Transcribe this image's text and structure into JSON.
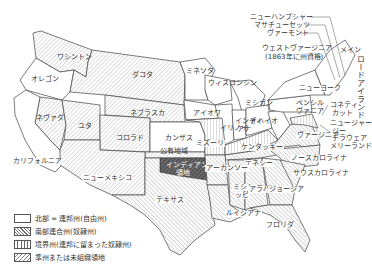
{
  "map": {
    "states": {
      "oregon": "オレゴン",
      "washington": "ワシントン",
      "dakota": "ダコタ",
      "nevada": "ネヴァダ",
      "utah": "ユタ",
      "nebraska": "ネブラスカ",
      "california": "カリフォルニア",
      "colorado": "コロラド",
      "kansas": "カンザス",
      "public_land": "公有地域",
      "new_mexico": "ニューメキシコ",
      "indian_territory_1": "インディアン",
      "indian_territory_2": "領地",
      "texas": "テキサス",
      "minnesota": "ミネソタ",
      "wisconsin": "ウィスコンシン",
      "iowa": "アイオワ",
      "michigan": "ミシガン",
      "illinois": "イリノイ",
      "indiana_1": "インディ",
      "indiana_2": "アナ",
      "ohio": "オハイオ",
      "missouri": "ミズーリ",
      "kentucky": "ケンタッキー",
      "west_virginia_1": "ウェストヴァージニア",
      "west_virginia_2": "(1863年に州資格)",
      "virginia": "ヴァージニア",
      "pennsylvania_1": "ペンシル",
      "pennsylvania_2": "ヴァニア",
      "new_york": "ニューヨーク",
      "new_hampshire": "ニューハンプシャー",
      "massachusetts": "マサチューセッツ",
      "vermont": "ヴァーモント",
      "maine": "メイン",
      "rhode_island": "ロードアイランド",
      "connecticut_1": "コネティ",
      "connecticut_2": "カット",
      "new_jersey_1": "ニュージャー",
      "new_jersey_2": "ジー",
      "delaware": "デラウェア",
      "maryland": "メリーランド",
      "tennessee": "テネシー",
      "arkansas": "アーカンソー",
      "north_carolina": "ノースカロライナ",
      "south_carolina": "サウスカロライナ",
      "mississippi_1": "ミシシ",
      "mississippi_2": "ッピ",
      "alabama": "アラバマ",
      "georgia": "ジョージア",
      "louisiana": "ルイジアナ",
      "florida": "フロリダ"
    },
    "colors": {
      "outline": "#444444",
      "hatch": "#777777",
      "indian_territory": "#444444",
      "background": "#ffffff"
    }
  },
  "legend": {
    "items": [
      {
        "key": "north",
        "label": "北部 = 連邦州(自由州)"
      },
      {
        "key": "south",
        "label": "南部連合州(奴隷州)"
      },
      {
        "key": "border",
        "label": "境界州(連邦に留まった奴隷州)"
      },
      {
        "key": "territory",
        "label": "準州または未組織領地"
      }
    ]
  }
}
